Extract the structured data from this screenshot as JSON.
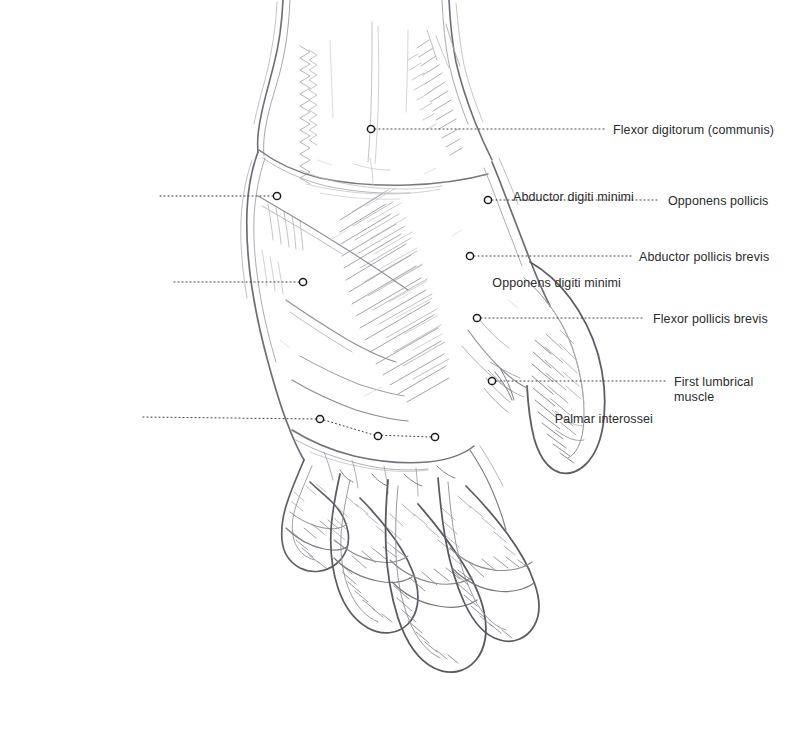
{
  "figure": {
    "style": "graphite pencil drawing",
    "background_color": "#ffffff",
    "ink_color": "#8a8a90",
    "dark_ink_color": "#55555c",
    "marker": {
      "shape": "open-circle",
      "radius_px": 3.6,
      "stroke_color": "#1c1c1c",
      "fill_color": "#ffffff",
      "stroke_width_px": 1.5
    },
    "leader_line": {
      "style": "dotted",
      "color": "#3a3a3a",
      "width_px": 1,
      "dash": "1 3"
    }
  },
  "annotations": [
    {
      "id": "flexor-digitorum-communis",
      "label": "Flexor digitorum (communis)",
      "side": "right",
      "lines": [
        "Flexor digitorum (communis)"
      ],
      "marker": {
        "x": 371,
        "y": 129
      },
      "leader": [
        [
          375,
          129
        ],
        [
          604,
          129
        ]
      ],
      "text_x": 613,
      "text_y": 123
    },
    {
      "id": "opponens-pollicis",
      "label": "Opponens pollicis",
      "side": "right",
      "lines": [
        "Opponens pollicis"
      ],
      "marker": {
        "x": 488,
        "y": 200
      },
      "leader": [
        [
          492,
          200
        ],
        [
          660,
          200
        ]
      ],
      "text_x": 668,
      "text_y": 194
    },
    {
      "id": "abductor-pollicis-brevis",
      "label": "Abductor pollicis brevis",
      "side": "right",
      "lines": [
        "Abductor pollicis brevis"
      ],
      "marker": {
        "x": 470,
        "y": 256
      },
      "leader": [
        [
          474,
          256
        ],
        [
          631,
          256
        ]
      ],
      "text_x": 639,
      "text_y": 250
    },
    {
      "id": "flexor-pollicis-brevis",
      "label": "Flexor pollicis brevis",
      "side": "right",
      "lines": [
        "Flexor pollicis brevis"
      ],
      "marker": {
        "x": 477,
        "y": 318
      },
      "leader": [
        [
          481,
          318
        ],
        [
          645,
          318
        ]
      ],
      "text_x": 653,
      "text_y": 312
    },
    {
      "id": "first-lumbrical-muscle",
      "label": "First lumbrical muscle",
      "side": "right",
      "lines": [
        "First lumbrical",
        "muscle"
      ],
      "marker": {
        "x": 492,
        "y": 381
      },
      "leader": [
        [
          496,
          381
        ],
        [
          666,
          381
        ]
      ],
      "text_x": 674,
      "text_y": 375
    },
    {
      "id": "abductor-digiti-minimi",
      "label": "Abductor digiti minimi",
      "side": "left",
      "lines": [
        "Abductor digiti minimi"
      ],
      "marker": {
        "x": 277,
        "y": 196
      },
      "leader": [
        [
          273,
          196
        ],
        [
          160,
          196
        ]
      ],
      "text_right": 634,
      "text_y": 190
    },
    {
      "id": "opponens-digiti-minimi",
      "label": "Opponens digiti minimi",
      "side": "left",
      "lines": [
        "Opponens digiti minimi"
      ],
      "marker": {
        "x": 303,
        "y": 282
      },
      "leader": [
        [
          299,
          282
        ],
        [
          173,
          282
        ]
      ],
      "text_right": 621,
      "text_y": 276
    },
    {
      "id": "palmar-interossei",
      "label": "Palmar interossei",
      "side": "left",
      "lines": [
        "Palmar interossei"
      ],
      "marker": {
        "x": 320,
        "y": 419
      },
      "extra_markers": [
        {
          "x": 378,
          "y": 436
        },
        {
          "x": 435,
          "y": 437
        }
      ],
      "leader": [
        [
          316,
          419
        ],
        [
          141,
          417
        ]
      ],
      "connector": [
        [
          324,
          420
        ],
        [
          374,
          435
        ],
        [
          431,
          437
        ]
      ],
      "text_right": 653,
      "text_y": 412
    }
  ]
}
